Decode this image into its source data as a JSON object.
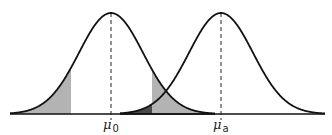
{
  "diagram": {
    "title": "",
    "type": "two-normal-distributions",
    "curves": [
      {
        "name": "null-distribution",
        "mean_label": "μ",
        "mean_sub": "0",
        "mean_px": 111
      },
      {
        "name": "alternative-distribution",
        "mean_label": "μ",
        "mean_sub": "a",
        "mean_px": 221
      }
    ],
    "geometry": {
      "baseline_y": 114,
      "peak_y": 13,
      "sigma_px": 32
    },
    "regions": [
      {
        "name": "left-rejection-tail",
        "from_px": 10,
        "to_px": 71,
        "under": "null-distribution",
        "color": "#b3b3b3"
      },
      {
        "name": "right-rejection-tail",
        "from_px": 152,
        "to_px": 215,
        "under": "null-distribution",
        "color": "#b3b3b3"
      },
      {
        "name": "beta-region",
        "from_px": 120,
        "to_px": 152,
        "under": "alternative-distribution",
        "color": "#4a4a4a"
      }
    ],
    "colors": {
      "line": "#111111",
      "shade_light": "#b3b3b3",
      "shade_dark": "#4a4a4a",
      "dash": "#222222"
    }
  },
  "labels": {
    "mu0": {
      "symbol": "μ",
      "sub": "0"
    },
    "mua": {
      "symbol": "μ",
      "sub": "a"
    }
  }
}
